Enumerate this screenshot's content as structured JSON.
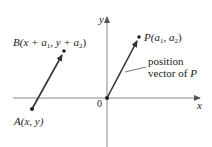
{
  "figure": {
    "axes": {
      "x_label": "x",
      "y_label": "y",
      "origin_label": "0"
    },
    "points": {
      "A": {
        "name": "A",
        "coords": "(x, y)"
      },
      "B": {
        "name": "B",
        "coords_pre": "(x + a",
        "sub1": "1",
        "coords_mid": ", y + a",
        "sub2": "2",
        "coords_post": ")"
      },
      "P": {
        "name": "P",
        "coords_pre": "(a",
        "sub1": "1",
        "coords_mid": ", a",
        "sub2": "2",
        "coords_post": ")"
      }
    },
    "annotation": {
      "line1": "position",
      "line2_pre": "vector of ",
      "line2_var": "P"
    },
    "colors": {
      "axis": "#777777",
      "vector": "#333333",
      "text": "#222222"
    }
  }
}
